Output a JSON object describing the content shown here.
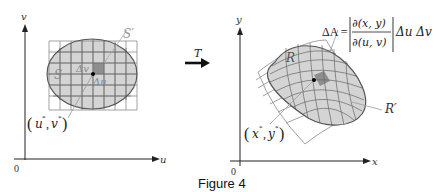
{
  "caption": "Figure 4",
  "left_panel": {
    "x_axis_label": "u",
    "y_axis_label": "v",
    "origin_label": "0",
    "region_label": "S",
    "grid_label": "S′",
    "delta_u_label": "Δu",
    "delta_v_label": "Δv",
    "point_label_open": "(",
    "point_label_u": "u",
    "point_label_comma": ",",
    "point_label_v": "v",
    "point_label_close": ")",
    "star": "*"
  },
  "transform": {
    "label": "T"
  },
  "right_panel": {
    "x_axis_label": "x",
    "y_axis_label": "y",
    "origin_label": "0",
    "region_label": "R",
    "grid_label": "R′",
    "point_label_x": "x",
    "point_label_y": "y",
    "point_label_open": "(",
    "point_label_comma": ",",
    "point_label_close": ")",
    "star": "*",
    "formula": {
      "lhs": "ΔA =",
      "numerator": "∂(x, y)",
      "denominator": "∂(u, v)",
      "rhs": "Δu Δv"
    }
  },
  "colors": {
    "region_fill": "#d4d4d4",
    "region_stroke": "#555555",
    "grid_stroke": "#8a8a8a",
    "highlight_cell": "#8e8e8e",
    "axis": "#222222"
  }
}
